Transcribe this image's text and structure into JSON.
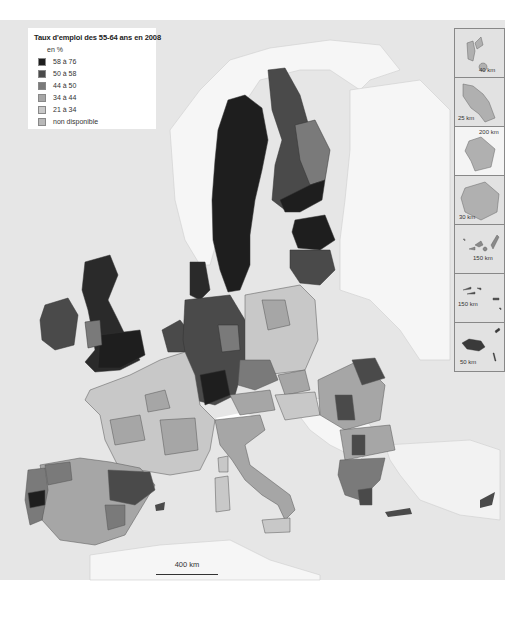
{
  "legend": {
    "title": "Taux d'emploi des 55-64 ans en 2008",
    "unit": "en %",
    "items": [
      {
        "label": "58 à 76",
        "color": "#1e1e1e"
      },
      {
        "label": "50 à 58",
        "color": "#4a4a4a"
      },
      {
        "label": "44 à 50",
        "color": "#7a7a7a"
      },
      {
        "label": "34 à 44",
        "color": "#a6a6a6"
      },
      {
        "label": "21 à 34",
        "color": "#c8c8c8"
      },
      {
        "label": "non disponible",
        "color": "#b8b8b8"
      }
    ]
  },
  "insets": [
    {
      "name": "guadeloupe",
      "scale": "40 km"
    },
    {
      "name": "martinique",
      "scale": "25 km"
    },
    {
      "name": "guyane",
      "scale": "200 km"
    },
    {
      "name": "reunion",
      "scale": "30 km"
    },
    {
      "name": "canarias",
      "scale": "150 km"
    },
    {
      "name": "acores",
      "scale": "150 km"
    },
    {
      "name": "madeira",
      "scale": "50 km"
    }
  ],
  "scale_bar": {
    "label": "400 km"
  },
  "colors": {
    "sea": "#e6e6e6",
    "non_eu_land": "#f4f4f4",
    "border": "#555555"
  }
}
